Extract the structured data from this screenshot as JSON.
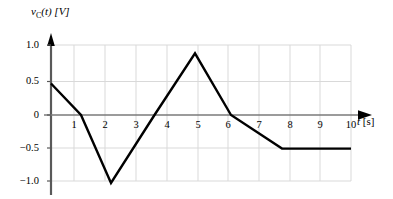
{
  "figure": {
    "background_color": "#ffffff",
    "curve_color": "#000000",
    "axis_color": "#595959",
    "grid_color": "#d9d9d9"
  },
  "axes": {
    "y_title_var": "v",
    "y_title_sub": "C",
    "y_title_rest": "(t) [V]",
    "x_title_var": "t",
    "x_title_rest": " [s]",
    "y_ticks": [
      "1.0",
      "0.5",
      "0",
      "−0.5",
      "−1.0"
    ],
    "x_ticks": [
      "1",
      "2",
      "3",
      "4",
      "5",
      "6",
      "7",
      "8",
      "9",
      "10"
    ]
  },
  "chart_data": {
    "type": "line",
    "title": "",
    "xlabel": "t [s]",
    "ylabel": "v_C(t) [V]",
    "xlim": [
      0,
      10
    ],
    "ylim": [
      -1.0,
      1.0
    ],
    "grid": true,
    "legend": "none",
    "x_tick_values": [
      1,
      2,
      3,
      4,
      5,
      6,
      7,
      8,
      9,
      10
    ],
    "y_tick_values": [
      1.0,
      0.5,
      0,
      -0.5,
      -1.0
    ],
    "series": [
      {
        "name": "v_C(t)",
        "x": [
          0,
          1,
          2,
          3.45,
          4.8,
          6,
          7.7,
          10
        ],
        "y": [
          0.45,
          0,
          -0.97,
          0,
          0.88,
          0,
          -0.48,
          -0.48
        ]
      }
    ]
  }
}
